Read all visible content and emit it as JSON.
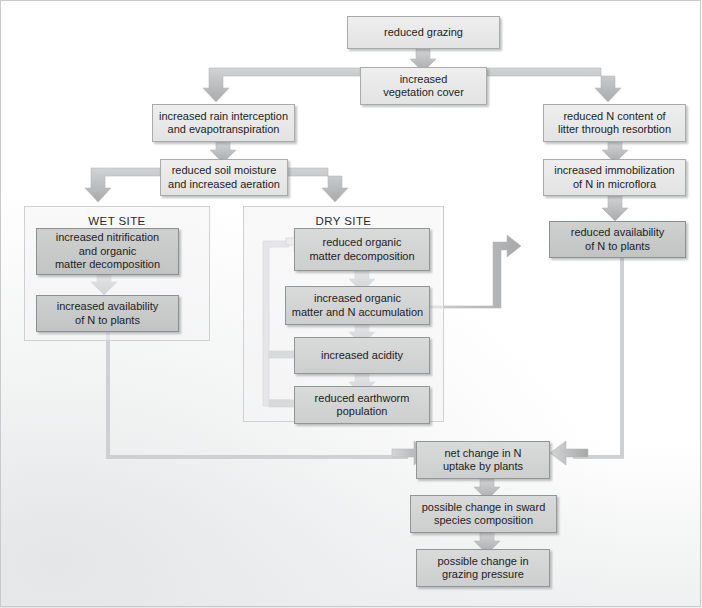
{
  "diagram": {
    "panels": [
      {
        "id": "wet",
        "label": "WET SITE"
      },
      {
        "id": "dry",
        "label": "DRY SITE"
      }
    ],
    "nodes": [
      {
        "id": "reduced_grazing",
        "label": "reduced grazing"
      },
      {
        "id": "veg_cover",
        "label": "increased\nvegetation cover"
      },
      {
        "id": "rain_interception",
        "label": "increased rain interception\nand evapotranspiration"
      },
      {
        "id": "litter_n",
        "label": "reduced N content of\nlitter through resorbtion"
      },
      {
        "id": "soil_moisture",
        "label": "reduced soil moisture\nand increased aeration"
      },
      {
        "id": "immobilization",
        "label": "increased immobilization\nof N in microflora"
      },
      {
        "id": "wet_nitrification",
        "label": "increased nitrification\nand organic\nmatter decomposition"
      },
      {
        "id": "dry_decomposition",
        "label": "reduced organic\nmatter decomposition"
      },
      {
        "id": "reduced_avail_n",
        "label": "reduced availability\nof N to plants"
      },
      {
        "id": "wet_avail_n",
        "label": "increased availability\nof N to plants"
      },
      {
        "id": "organic_accumulation",
        "label": "increased organic\nmatter and N accumulation"
      },
      {
        "id": "acidity",
        "label": "increased acidity"
      },
      {
        "id": "earthworm",
        "label": "reduced earthworm\npopulation"
      },
      {
        "id": "net_change",
        "label": "net change in N\nuptake by plants"
      },
      {
        "id": "sward",
        "label": "possible change in sward\nspecies composition"
      },
      {
        "id": "grazing_pressure",
        "label": "possible change in\ngrazing pressure"
      }
    ],
    "edges": [
      {
        "from": "reduced_grazing",
        "to": "veg_cover"
      },
      {
        "from": "veg_cover",
        "to": "rain_interception"
      },
      {
        "from": "veg_cover",
        "to": "litter_n"
      },
      {
        "from": "rain_interception",
        "to": "soil_moisture"
      },
      {
        "from": "litter_n",
        "to": "immobilization"
      },
      {
        "from": "immobilization",
        "to": "reduced_avail_n"
      },
      {
        "from": "soil_moisture",
        "to": "wet_nitrification"
      },
      {
        "from": "soil_moisture",
        "to": "dry_decomposition"
      },
      {
        "from": "wet_nitrification",
        "to": "wet_avail_n"
      },
      {
        "from": "dry_decomposition",
        "to": "organic_accumulation"
      },
      {
        "from": "organic_accumulation",
        "to": "acidity"
      },
      {
        "from": "organic_accumulation",
        "to": "reduced_avail_n"
      },
      {
        "from": "acidity",
        "to": "earthworm"
      },
      {
        "from": "acidity",
        "to": "dry_decomposition"
      },
      {
        "from": "earthworm",
        "to": "dry_decomposition"
      },
      {
        "from": "wet_avail_n",
        "to": "net_change"
      },
      {
        "from": "reduced_avail_n",
        "to": "net_change"
      },
      {
        "from": "net_change",
        "to": "sward"
      },
      {
        "from": "sward",
        "to": "grazing_pressure"
      }
    ],
    "colors": {
      "box_light": "#e6e6e7",
      "box_dark": "#c8c9c9",
      "border": "#9a9b9c",
      "arrow": "#b4b5b6",
      "text": "#1d1d1d",
      "page": "#ffffff"
    }
  }
}
